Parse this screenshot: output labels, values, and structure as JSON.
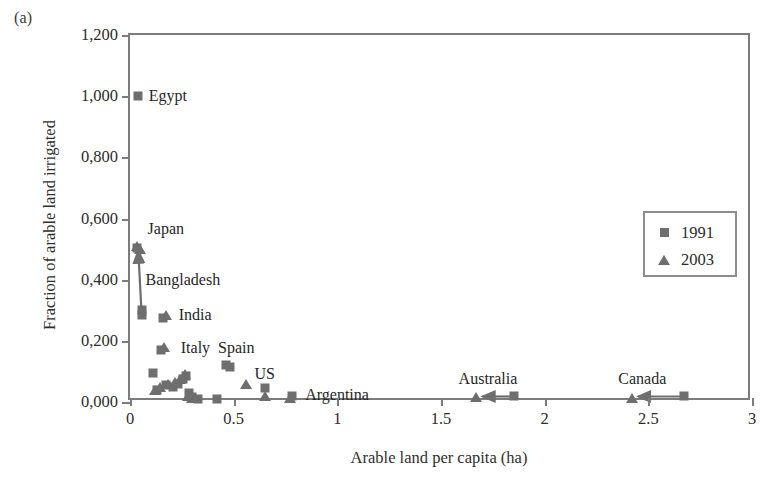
{
  "figure": {
    "panel_letter": "(a)",
    "marker_color": "#6e6e6e",
    "frame_color": "#7c7c7c"
  },
  "legend": {
    "position": "upper-right",
    "entries": [
      {
        "label": "1991",
        "marker": "square-marker"
      },
      {
        "label": "2003",
        "marker": "triangle-marker"
      }
    ]
  },
  "chart_data": {
    "type": "scatter",
    "title": "",
    "xlabel": "Arable land per capita (ha)",
    "ylabel": "Fraction of arable land irrigated",
    "xlim": [
      0,
      3
    ],
    "ylim": [
      0,
      1.2
    ],
    "grid": false,
    "xticks": [
      0,
      0.5,
      1,
      1.5,
      2,
      2.5,
      3
    ],
    "xticklabels": [
      "0",
      "0.5",
      "1",
      "1.5",
      "2",
      "2.5",
      "3"
    ],
    "yticks": [
      0,
      0.2,
      0.4,
      0.6,
      0.8,
      1.0,
      1.2
    ],
    "yticklabels": [
      "0,000",
      "0,200",
      "0,400",
      "0,600",
      "0,800",
      "1,000",
      "1,200"
    ],
    "legend": [
      "1991",
      "2003"
    ],
    "series": [
      {
        "name": "1991",
        "marker": "square",
        "points": [
          {
            "x": 0.04,
            "y": 1.0,
            "country": "Egypt"
          },
          {
            "x": 0.035,
            "y": 0.505,
            "country": "Japan"
          },
          {
            "x": 0.06,
            "y": 0.3,
            "country": "Bangladesh"
          },
          {
            "x": 0.06,
            "y": 0.285,
            "country": ""
          },
          {
            "x": 0.16,
            "y": 0.275,
            "country": "India"
          },
          {
            "x": 0.15,
            "y": 0.17,
            "country": ""
          },
          {
            "x": 0.11,
            "y": 0.095,
            "country": ""
          },
          {
            "x": 0.13,
            "y": 0.04,
            "country": ""
          },
          {
            "x": 0.175,
            "y": 0.055,
            "country": ""
          },
          {
            "x": 0.205,
            "y": 0.05,
            "country": ""
          },
          {
            "x": 0.23,
            "y": 0.06,
            "country": ""
          },
          {
            "x": 0.255,
            "y": 0.075,
            "country": ""
          },
          {
            "x": 0.27,
            "y": 0.085,
            "country": ""
          },
          {
            "x": 0.285,
            "y": 0.03,
            "country": ""
          },
          {
            "x": 0.3,
            "y": 0.015,
            "country": ""
          },
          {
            "x": 0.33,
            "y": 0.01,
            "country": ""
          },
          {
            "x": 0.42,
            "y": 0.01,
            "country": ""
          },
          {
            "x": 0.465,
            "y": 0.12,
            "country": "Spain"
          },
          {
            "x": 0.48,
            "y": 0.115,
            "country": ""
          },
          {
            "x": 0.65,
            "y": 0.045,
            "country": "US"
          },
          {
            "x": 0.78,
            "y": 0.02,
            "country": "Argentina"
          },
          {
            "x": 1.85,
            "y": 0.018,
            "country": "Australia"
          },
          {
            "x": 2.67,
            "y": 0.018,
            "country": "Canada"
          }
        ]
      },
      {
        "name": "2003",
        "marker": "triangle",
        "points": [
          {
            "x": 0.035,
            "y": 0.51,
            "country": "Japan"
          },
          {
            "x": 0.05,
            "y": 0.5,
            "country": "Bangladesh"
          },
          {
            "x": 0.175,
            "y": 0.285,
            "country": "India"
          },
          {
            "x": 0.165,
            "y": 0.18,
            "country": "Italy"
          },
          {
            "x": 0.12,
            "y": 0.04,
            "country": ""
          },
          {
            "x": 0.145,
            "y": 0.05,
            "country": ""
          },
          {
            "x": 0.185,
            "y": 0.06,
            "country": ""
          },
          {
            "x": 0.215,
            "y": 0.065,
            "country": ""
          },
          {
            "x": 0.24,
            "y": 0.075,
            "country": ""
          },
          {
            "x": 0.265,
            "y": 0.09,
            "country": ""
          },
          {
            "x": 0.28,
            "y": 0.02,
            "country": ""
          },
          {
            "x": 0.3,
            "y": 0.012,
            "country": ""
          },
          {
            "x": 0.315,
            "y": 0.012,
            "country": ""
          },
          {
            "x": 0.56,
            "y": 0.058,
            "country": ""
          },
          {
            "x": 0.65,
            "y": 0.02,
            "country": "US"
          },
          {
            "x": 0.77,
            "y": 0.012,
            "country": "Argentina"
          },
          {
            "x": 1.67,
            "y": 0.015,
            "country": "Australia"
          },
          {
            "x": 2.42,
            "y": 0.012,
            "country": "Canada"
          }
        ]
      }
    ],
    "annotations": [
      {
        "text": "Egypt",
        "x": 0.09,
        "y": 1.0
      },
      {
        "text": "Japan",
        "x": 0.085,
        "y": 0.565
      },
      {
        "text": "Bangladesh",
        "x": 0.075,
        "y": 0.4
      },
      {
        "text": "India",
        "x": 0.235,
        "y": 0.285
      },
      {
        "text": "Italy",
        "x": 0.245,
        "y": 0.175
      },
      {
        "text": "Spain",
        "x": 0.425,
        "y": 0.175
      },
      {
        "text": "US",
        "x": 0.6,
        "y": 0.09
      },
      {
        "text": "Argentina",
        "x": 0.845,
        "y": 0.022
      },
      {
        "text": "Australia",
        "x": 1.585,
        "y": 0.075
      },
      {
        "text": "Canada",
        "x": 2.355,
        "y": 0.075
      }
    ],
    "connectors": [
      {
        "country": "Bangladesh",
        "from": {
          "x": 0.055,
          "y": 0.3
        },
        "to": {
          "x": 0.04,
          "y": 0.495
        }
      },
      {
        "country": "Australia",
        "from": {
          "x": 1.85,
          "y": 0.018
        },
        "to": {
          "x": 1.7,
          "y": 0.018
        }
      },
      {
        "country": "Canada",
        "from": {
          "x": 2.67,
          "y": 0.018
        },
        "to": {
          "x": 2.45,
          "y": 0.018
        }
      }
    ]
  }
}
